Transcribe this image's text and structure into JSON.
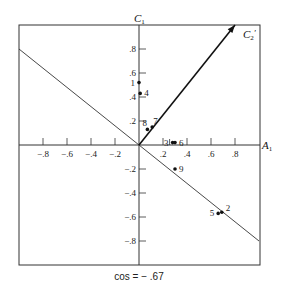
{
  "chart_data": {
    "type": "scatter",
    "title": "",
    "caption": "cos = − .67",
    "xlabel": "A1",
    "ylabel": "C1",
    "xlim": [
      -1.0,
      1.0
    ],
    "ylim": [
      -1.0,
      1.0
    ],
    "grid": false,
    "x_ticks": [
      -0.8,
      -0.6,
      -0.4,
      -0.2,
      0.2,
      0.4,
      0.6,
      0.8
    ],
    "x_tick_labels": [
      "−.8",
      "−.6",
      "−.4",
      "−.2",
      ".2",
      ".4",
      ".6",
      ".8"
    ],
    "y_ticks": [
      0.8,
      0.6,
      0.4,
      0.2,
      -0.2,
      -0.4,
      -0.6,
      -0.8
    ],
    "y_tick_labels": [
      ".8",
      ".6",
      ".4",
      ".2",
      "−.2",
      "−.4",
      "−.6",
      "−.8"
    ],
    "points": [
      {
        "label": "1",
        "x": 0.0,
        "y": 0.52,
        "label_side": "left"
      },
      {
        "label": "2",
        "x": 0.69,
        "y": -0.56,
        "label_side": "right"
      },
      {
        "label": "3",
        "x": 0.28,
        "y": 0.02,
        "label_side": "left"
      },
      {
        "label": "4",
        "x": 0.01,
        "y": 0.43,
        "label_side": "right"
      },
      {
        "label": "5",
        "x": 0.66,
        "y": -0.57,
        "label_side": "left"
      },
      {
        "label": "6",
        "x": 0.3,
        "y": 0.02,
        "label_side": "right"
      },
      {
        "label": "7",
        "x": 0.11,
        "y": 0.15,
        "label_side": "above"
      },
      {
        "label": "8",
        "x": 0.07,
        "y": 0.13,
        "label_side": "above-left"
      },
      {
        "label": "9",
        "x": 0.3,
        "y": -0.2,
        "label_side": "right"
      }
    ],
    "lines": [
      {
        "name": "orthogonal-line",
        "from": [
          -1.0,
          0.8
        ],
        "to": [
          1.0,
          -0.8
        ]
      }
    ],
    "vectors": [
      {
        "name": "C2'",
        "label": "C₂′",
        "from": [
          0,
          0
        ],
        "to": [
          0.8,
          1.0
        ]
      }
    ]
  },
  "labels": {
    "x_axis": "A",
    "x_axis_sub": "1",
    "y_axis": "C",
    "y_axis_sub": "1",
    "vector": "C",
    "vector_sub": "2",
    "vector_prime": "′",
    "caption": "cos = − .67"
  }
}
